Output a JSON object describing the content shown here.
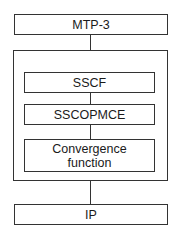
{
  "diagram": {
    "type": "protocol-stack",
    "top_layer": {
      "label": "MTP-3"
    },
    "container": {
      "layers": [
        {
          "label": "SSCF"
        },
        {
          "label": "SSCOPMCE"
        },
        {
          "label": "Convergence function"
        }
      ]
    },
    "bottom_layer": {
      "label": "IP"
    },
    "colors": {
      "stroke": "#333333",
      "background": "#ffffff",
      "text": "#1a1a1a"
    }
  }
}
